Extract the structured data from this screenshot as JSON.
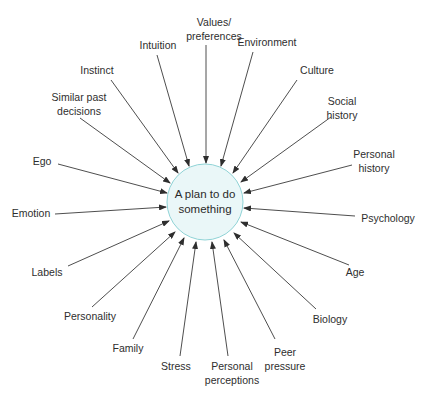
{
  "diagram": {
    "type": "radial-influence",
    "center": {
      "label_line1": "A plan to do",
      "label_line2": "something",
      "x": 205,
      "y": 202,
      "r": 38,
      "fill": "#eaf7f8",
      "stroke": "#8fd3d6"
    },
    "line_color": "#3a3a3a",
    "factors": [
      {
        "id": "values-preferences",
        "line1": "Values/",
        "line2": "preferences",
        "tx": 214,
        "ty": 29,
        "x1": 206,
        "y1": 45,
        "x2": 206,
        "y2": 163
      },
      {
        "id": "intuition",
        "line1": "Intuition",
        "line2": "",
        "tx": 158,
        "ty": 45,
        "x1": 157,
        "y1": 55,
        "x2": 189,
        "y2": 166
      },
      {
        "id": "environment",
        "line1": "Environment",
        "line2": "",
        "tx": 267,
        "ty": 42,
        "x1": 253,
        "y1": 52,
        "x2": 221,
        "y2": 166
      },
      {
        "id": "instinct",
        "line1": "Instinct",
        "line2": "",
        "tx": 97,
        "ty": 70,
        "x1": 111,
        "y1": 80,
        "x2": 178,
        "y2": 173
      },
      {
        "id": "culture",
        "line1": "Culture",
        "line2": "",
        "tx": 317,
        "ty": 70,
        "x1": 297,
        "y1": 80,
        "x2": 233,
        "y2": 173
      },
      {
        "id": "similar-past-decisions",
        "line1": "Similar past",
        "line2": "decisions",
        "tx": 79,
        "ty": 104,
        "x1": 80,
        "y1": 118,
        "x2": 170,
        "y2": 183
      },
      {
        "id": "social-history",
        "line1": "Social",
        "line2": "history",
        "tx": 342,
        "ty": 108,
        "x1": 331,
        "y1": 117,
        "x2": 241,
        "y2": 182
      },
      {
        "id": "personal-history",
        "line1": "Personal",
        "line2": "history",
        "tx": 374,
        "ty": 161,
        "x1": 352,
        "y1": 165,
        "x2": 244,
        "y2": 193
      },
      {
        "id": "ego",
        "line1": "Ego",
        "line2": "",
        "tx": 42,
        "ty": 161,
        "x1": 58,
        "y1": 164,
        "x2": 167,
        "y2": 193
      },
      {
        "id": "emotion",
        "line1": "Emotion",
        "line2": "",
        "tx": 31,
        "ty": 213,
        "x1": 55,
        "y1": 214,
        "x2": 166,
        "y2": 207
      },
      {
        "id": "psychology",
        "line1": "Psychology",
        "line2": "",
        "tx": 388,
        "ty": 218,
        "x1": 355,
        "y1": 216,
        "x2": 244,
        "y2": 208
      },
      {
        "id": "labels",
        "line1": "Labels",
        "line2": "",
        "tx": 47,
        "ty": 272,
        "x1": 68,
        "y1": 266,
        "x2": 169,
        "y2": 221
      },
      {
        "id": "age",
        "line1": "Age",
        "line2": "",
        "tx": 355,
        "ty": 272,
        "x1": 349,
        "y1": 265,
        "x2": 241,
        "y2": 222
      },
      {
        "id": "personality",
        "line1": "Personality",
        "line2": "",
        "tx": 90,
        "ty": 316,
        "x1": 92,
        "y1": 307,
        "x2": 175,
        "y2": 232
      },
      {
        "id": "biology",
        "line1": "Biology",
        "line2": "",
        "tx": 330,
        "ty": 319,
        "x1": 316,
        "y1": 309,
        "x2": 234,
        "y2": 233
      },
      {
        "id": "family",
        "line1": "Family",
        "line2": "",
        "tx": 128,
        "ty": 348,
        "x1": 133,
        "y1": 339,
        "x2": 184,
        "y2": 238
      },
      {
        "id": "stress",
        "line1": "Stress",
        "line2": "",
        "tx": 176,
        "ty": 366,
        "x1": 180,
        "y1": 356,
        "x2": 196,
        "y2": 242
      },
      {
        "id": "personal-perceptions",
        "line1": "Personal",
        "line2": "perceptions",
        "tx": 232,
        "ty": 373,
        "x1": 228,
        "y1": 356,
        "x2": 212,
        "y2": 242
      },
      {
        "id": "peer-pressure",
        "line1": "Peer",
        "line2": "pressure",
        "tx": 285,
        "ty": 359,
        "x1": 275,
        "y1": 339,
        "x2": 224,
        "y2": 240
      }
    ]
  }
}
